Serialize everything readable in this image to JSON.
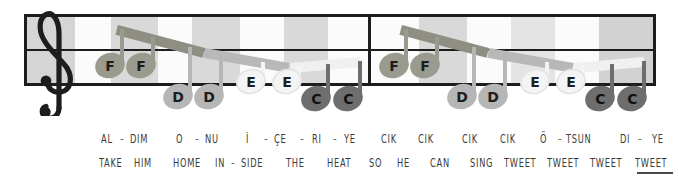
{
  "score": {
    "clef": "treble-clef",
    "staff": {
      "left": 24,
      "top": 14,
      "width": 632,
      "height": 72,
      "border_color": "#1d1d1d",
      "lines_y": [
        0,
        35,
        69
      ]
    },
    "barlines_x": [
      368
    ],
    "background_bands": [
      {
        "x": 27,
        "w": 48,
        "color": "#d5d5d5"
      },
      {
        "x": 75,
        "w": 36,
        "color": "#fbfbfb"
      },
      {
        "x": 111,
        "w": 47,
        "color": "#d9d9d9"
      },
      {
        "x": 158,
        "w": 34,
        "color": "#fbfbfb"
      },
      {
        "x": 192,
        "w": 48,
        "color": "#d9d9d9"
      },
      {
        "x": 240,
        "w": 44,
        "color": "#fbfbfb"
      },
      {
        "x": 284,
        "w": 44,
        "color": "#d9d9d9"
      },
      {
        "x": 328,
        "w": 40,
        "color": "#fbfbfb"
      },
      {
        "x": 371,
        "w": 48,
        "color": "#fbfbfb"
      },
      {
        "x": 419,
        "w": 48,
        "color": "#d9d9d9"
      },
      {
        "x": 467,
        "w": 44,
        "color": "#fbfbfb"
      },
      {
        "x": 511,
        "w": 44,
        "color": "#e4e4e4"
      },
      {
        "x": 555,
        "w": 44,
        "color": "#fbfbfb"
      },
      {
        "x": 599,
        "w": 54,
        "color": "#d2d2d2"
      }
    ],
    "note_colors": {
      "F": "#9a9a8e",
      "D": "#b6b6b6",
      "E": "#f4f4f4",
      "C": "#6e6e6e"
    },
    "beam_colors": {
      "F": "#8e8e82",
      "D": "#b0b0b0",
      "E": "#f0f0f0",
      "C": "#666666"
    },
    "notes": [
      {
        "name": "F",
        "x": 95,
        "y": 53,
        "color": "#9a9a8e",
        "stem": "up"
      },
      {
        "name": "F",
        "x": 126,
        "y": 53,
        "color": "#9a9a8e",
        "stem": "up"
      },
      {
        "name": "D",
        "x": 163,
        "y": 84,
        "color": "#b6b6b6",
        "stem": "up"
      },
      {
        "name": "D",
        "x": 194,
        "y": 84,
        "color": "#b6b6b6",
        "stem": "up"
      },
      {
        "name": "E",
        "x": 236,
        "y": 69,
        "color": "#f4f4f4",
        "stem": "up"
      },
      {
        "name": "E",
        "x": 272,
        "y": 69,
        "color": "#f4f4f4",
        "stem": "up"
      },
      {
        "name": "C",
        "x": 301,
        "y": 86,
        "color": "#6e6e6e",
        "stem": "up"
      },
      {
        "name": "C",
        "x": 333,
        "y": 86,
        "color": "#6e6e6e",
        "stem": "up"
      },
      {
        "name": "F",
        "x": 379,
        "y": 53,
        "color": "#9a9a8e",
        "stem": "up"
      },
      {
        "name": "F",
        "x": 410,
        "y": 53,
        "color": "#9a9a8e",
        "stem": "up"
      },
      {
        "name": "D",
        "x": 447,
        "y": 84,
        "color": "#b6b6b6",
        "stem": "up"
      },
      {
        "name": "D",
        "x": 478,
        "y": 84,
        "color": "#b6b6b6",
        "stem": "up"
      },
      {
        "name": "E",
        "x": 520,
        "y": 69,
        "color": "#f4f4f4",
        "stem": "up"
      },
      {
        "name": "E",
        "x": 556,
        "y": 69,
        "color": "#f4f4f4",
        "stem": "up"
      },
      {
        "name": "C",
        "x": 585,
        "y": 86,
        "color": "#6e6e6e",
        "stem": "up"
      },
      {
        "name": "C",
        "x": 617,
        "y": 86,
        "color": "#6e6e6e",
        "stem": "up"
      }
    ],
    "beams": [
      {
        "x1": 118,
        "y1": 25,
        "x2": 205,
        "y2": 48,
        "color": "#8e8e82",
        "thickness": 10
      },
      {
        "x1": 205,
        "y1": 48,
        "x2": 290,
        "y2": 63,
        "color": "#b8b8b8",
        "thickness": 10
      },
      {
        "x1": 290,
        "y1": 63,
        "x2": 360,
        "y2": 57,
        "color": "#f0f0f0",
        "thickness": 10
      },
      {
        "x1": 402,
        "y1": 25,
        "x2": 489,
        "y2": 48,
        "color": "#8e8e82",
        "thickness": 10
      },
      {
        "x1": 489,
        "y1": 48,
        "x2": 574,
        "y2": 63,
        "color": "#b8b8b8",
        "thickness": 10
      },
      {
        "x1": 574,
        "y1": 63,
        "x2": 644,
        "y2": 57,
        "color": "#f0f0f0",
        "thickness": 10
      }
    ]
  },
  "lyrics": {
    "turkish": {
      "label": "turkish-lyrics",
      "syllables": [
        {
          "text": "AL",
          "x": 101
        },
        {
          "text": "DIM",
          "x": 130
        },
        {
          "text": "O",
          "x": 176
        },
        {
          "text": "NU",
          "x": 205
        },
        {
          "text": "İ",
          "x": 246
        },
        {
          "text": "ÇE",
          "x": 274
        },
        {
          "text": "RI",
          "x": 312
        },
        {
          "text": "YE",
          "x": 344
        },
        {
          "text": "CIK",
          "x": 381
        },
        {
          "text": "CIK",
          "x": 418
        },
        {
          "text": "CIK",
          "x": 462
        },
        {
          "text": "CIK",
          "x": 500
        },
        {
          "text": "Ö",
          "x": 540
        },
        {
          "text": "TSUN",
          "x": 566
        },
        {
          "text": "DI",
          "x": 620
        },
        {
          "text": "YE",
          "x": 652
        }
      ],
      "dashes_x": [
        120,
        195,
        264,
        300,
        333,
        558,
        638
      ]
    },
    "english": {
      "label": "english-lyrics",
      "syllables": [
        {
          "text": "TAKE",
          "x": 99
        },
        {
          "text": "HIM",
          "x": 134
        },
        {
          "text": "HOME",
          "x": 173
        },
        {
          "text": "IN",
          "x": 215
        },
        {
          "text": "SIDE",
          "x": 241
        },
        {
          "text": "THE",
          "x": 286
        },
        {
          "text": "HEAT",
          "x": 327
        },
        {
          "text": "SO",
          "x": 369
        },
        {
          "text": "HE",
          "x": 397
        },
        {
          "text": "CAN",
          "x": 430
        },
        {
          "text": "SING",
          "x": 470
        },
        {
          "text": "TWEET",
          "x": 504
        },
        {
          "text": "TWEET",
          "x": 547
        },
        {
          "text": "TWEET",
          "x": 590
        },
        {
          "text": "TWEET",
          "x": 635
        }
      ],
      "dashes_x": [
        231
      ],
      "extender": {
        "x": 637,
        "y": 16,
        "w": 36
      }
    }
  }
}
